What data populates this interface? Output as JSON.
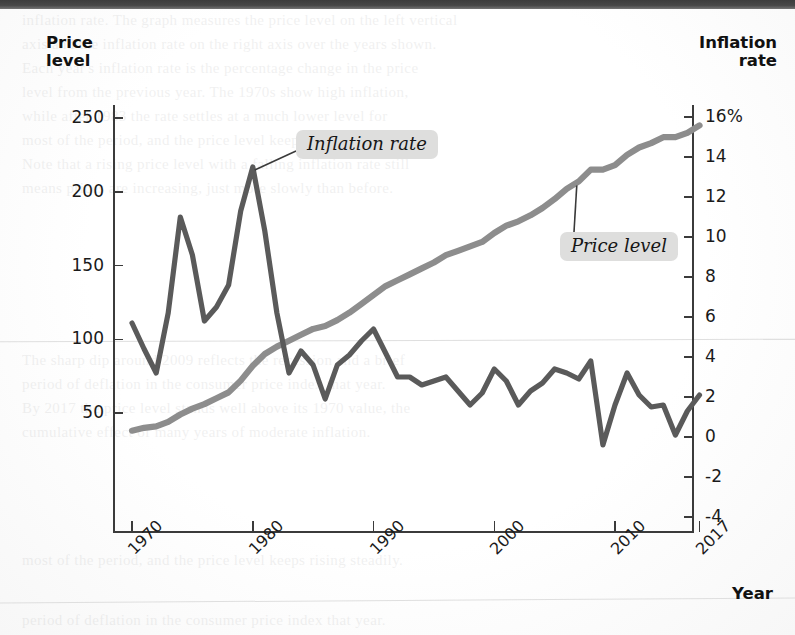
{
  "figure": {
    "left_axis_title": "Price\nlevel",
    "left_axis_title_line1": "Price",
    "left_axis_title_line2": "level",
    "right_axis_title_line1": "Inflation",
    "right_axis_title_line2": "rate",
    "x_axis_title": "Year",
    "callout_inflation": "Inflation rate",
    "callout_price": "Price level"
  },
  "colors": {
    "price_level_line": "#8d8d8d",
    "inflation_line": "#5a5a5a",
    "axis": "#3b3b3b",
    "text": "#1a1a1a",
    "callout_background": "#dededd",
    "scan_rule": "#dcdcdc"
  },
  "chart_data": {
    "type": "line",
    "title": "",
    "xlabel": "Year",
    "grid": false,
    "legend": "inline-callouts",
    "xlim": [
      1969,
      2017
    ],
    "x_ticks": [
      "1970",
      "1980",
      "1990",
      "2000",
      "2010",
      "2017"
    ],
    "x_tick_values": [
      1970,
      1980,
      1990,
      2000,
      2010,
      2017
    ],
    "left_axis": {
      "label": "Price level",
      "ticks": [
        "50",
        "100",
        "150",
        "200",
        "250"
      ],
      "tick_values": [
        50,
        100,
        150,
        200,
        250
      ],
      "ylim": [
        0,
        265
      ]
    },
    "right_axis": {
      "label": "Inflation rate",
      "ticks": [
        "-4",
        "-2",
        "0",
        "2",
        "4",
        "6",
        "8",
        "10",
        "12",
        "14",
        "16%"
      ],
      "tick_values": [
        -4,
        -2,
        0,
        2,
        4,
        6,
        8,
        10,
        12,
        14,
        16
      ],
      "ylim": [
        -4,
        16
      ]
    },
    "x": [
      1970,
      1971,
      1972,
      1973,
      1974,
      1975,
      1976,
      1977,
      1978,
      1979,
      1980,
      1981,
      1982,
      1983,
      1984,
      1985,
      1986,
      1987,
      1988,
      1989,
      1990,
      1991,
      1992,
      1993,
      1994,
      1995,
      1996,
      1997,
      1998,
      1999,
      2000,
      2001,
      2002,
      2003,
      2004,
      2005,
      2006,
      2007,
      2008,
      2009,
      2010,
      2011,
      2012,
      2013,
      2014,
      2015,
      2016,
      2017
    ],
    "series": [
      {
        "name": "Price level",
        "axis": "left",
        "color": "#8d8d8d",
        "values": [
          38,
          40,
          41,
          44,
          49,
          53,
          56,
          60,
          64,
          72,
          82,
          90,
          95,
          99,
          103,
          107,
          109,
          113,
          118,
          124,
          130,
          136,
          140,
          144,
          148,
          152,
          157,
          160,
          163,
          166,
          172,
          177,
          180,
          184,
          189,
          195,
          202,
          207,
          215,
          215,
          218,
          225,
          230,
          233,
          237,
          237,
          240,
          245
        ]
      },
      {
        "name": "Inflation rate",
        "axis": "right",
        "color": "#5a5a5a",
        "values": [
          5.7,
          4.4,
          3.2,
          6.2,
          11.0,
          9.1,
          5.8,
          6.5,
          7.6,
          11.3,
          13.5,
          10.3,
          6.2,
          3.2,
          4.3,
          3.6,
          1.9,
          3.6,
          4.1,
          4.8,
          5.4,
          4.2,
          3.0,
          3.0,
          2.6,
          2.8,
          3.0,
          2.3,
          1.6,
          2.2,
          3.4,
          2.8,
          1.6,
          2.3,
          2.7,
          3.4,
          3.2,
          2.9,
          3.8,
          -0.4,
          1.6,
          3.2,
          2.1,
          1.5,
          1.6,
          0.1,
          1.3,
          2.1
        ]
      }
    ],
    "annotations": [
      {
        "text": "Inflation rate",
        "points_to_year": 1980,
        "points_to_value": 13.5
      },
      {
        "text": "Price level",
        "points_to_year": 2007,
        "points_to_value": 207
      }
    ]
  },
  "ghost_text": [
    "inflation rate. The graph measures the price level on the left vertical",
    "axis and the inflation rate on the right axis over the years shown.",
    "Each year's inflation rate is the percentage change in the price",
    "level from the previous year. The 1970s show high inflation,",
    "while after 1983 the rate settles at a much lower level for",
    "most of the period, and the price level keeps rising steadily.",
    "Note that a rising price level with a falling inflation rate still",
    "means prices are increasing, just more slowly than before.",
    "The sharp dip around 2009 reflects the recession and a brief",
    "period of deflation in the consumer price index that year.",
    "By 2017 the price level stands well above its 1970 value, the",
    "cumulative effect of many years of moderate inflation."
  ]
}
